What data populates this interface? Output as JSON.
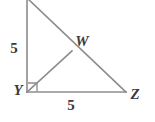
{
  "figure": {
    "type": "geometry-diagram",
    "shape": "right-triangle-with-cevian",
    "background_color": "#ffffff",
    "line_color": "#8c8c8c",
    "label_color": "#3a3a3a",
    "width": 155,
    "height": 122
  },
  "vertices": [
    {
      "id": "apex",
      "label": "",
      "x": 27,
      "y": 0
    },
    {
      "id": "W",
      "label": "W",
      "x": 72,
      "y": 51,
      "label_x": 82,
      "label_y": 46
    },
    {
      "id": "Y",
      "label": "Y",
      "x": 27,
      "y": 92,
      "label_x": 18,
      "label_y": 95
    },
    {
      "id": "Z",
      "label": "Z",
      "x": 126,
      "y": 92,
      "label_x": 135,
      "label_y": 99
    }
  ],
  "segments": [
    {
      "id": "left-leg",
      "from": "apex",
      "to": "Y"
    },
    {
      "id": "bottom-leg",
      "from": "Y",
      "to": "Z"
    },
    {
      "id": "hypotenuse",
      "from": "apex",
      "to": "Z"
    },
    {
      "id": "cevian-YW",
      "from": "Y",
      "to": "W"
    }
  ],
  "measure_labels": [
    {
      "id": "left-side-measure",
      "text": "5",
      "x": 14,
      "y": 53
    },
    {
      "id": "bottom-side-measure",
      "text": "5",
      "x": 71,
      "y": 110
    }
  ],
  "right_angle": {
    "id": "right-angle-marker",
    "at_vertex": "Y",
    "size": 9,
    "description": "square marker indicating 90 degrees at Y"
  }
}
